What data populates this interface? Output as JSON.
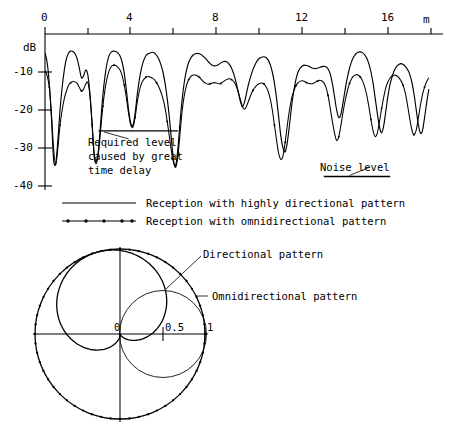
{
  "figure": {
    "title": "",
    "cartesian": {
      "xaxis": {
        "label": "m",
        "ticks_major": [
          "0",
          "4",
          "8",
          "12",
          "16"
        ],
        "tick_values_major": [
          0,
          4,
          8,
          12,
          16
        ],
        "tick_values_minor": [
          2,
          6,
          10,
          14,
          18
        ],
        "range": [
          0,
          18
        ],
        "position": "top"
      },
      "yaxis": {
        "label": "dB",
        "ticks": [
          "-10",
          "-20",
          "-30",
          "-40"
        ],
        "tick_values": [
          -10,
          -20,
          -30,
          -40
        ],
        "range": [
          -40,
          0
        ]
      },
      "annotations": [
        {
          "name": "required-level",
          "text_lines": [
            "Required level",
            "caused by great",
            "time delay"
          ],
          "bar_x": [
            2.5,
            6.2
          ],
          "bar_db": -25.5
        },
        {
          "name": "noise-level",
          "text_lines": [
            "Noise level"
          ],
          "bar_x": [
            13.0,
            16.1
          ],
          "bar_db": -37.5
        }
      ],
      "legend": [
        {
          "label": "Reception with highly directional pattern",
          "style": "solid"
        },
        {
          "label": "Reception with omnidirectional pattern",
          "style": "dotted"
        }
      ]
    },
    "polar": {
      "radial_ticks": [
        "0",
        "0.5",
        "1"
      ],
      "radial_tick_values": [
        0,
        0.5,
        1
      ],
      "labels": [
        {
          "name": "directional-pattern",
          "text": "Directional pattern"
        },
        {
          "name": "omnidirectional-pattern",
          "text": "Omnidirectional pattern"
        }
      ]
    }
  },
  "chart_data": [
    {
      "type": "line",
      "name": "reception-level-vs-distance",
      "title": "",
      "xlabel": "m",
      "ylabel": "dB",
      "xlim": [
        0,
        18
      ],
      "ylim": [
        -40,
        0
      ],
      "grid": false,
      "legend_position": "below",
      "x": [
        0,
        0.1,
        0.2,
        0.3,
        0.4,
        0.5,
        0.6,
        0.7,
        0.8,
        0.9,
        1,
        1.1,
        1.2,
        1.3,
        1.4,
        1.5,
        1.6,
        1.7,
        1.8,
        1.9,
        2,
        2.1,
        2.2,
        2.3,
        2.4,
        2.5,
        2.6,
        2.7,
        2.8,
        2.9,
        3,
        3.1,
        3.2,
        3.3,
        3.4,
        3.5,
        3.6,
        3.7,
        3.8,
        3.9,
        4,
        4.1,
        4.2,
        4.3,
        4.4,
        4.5,
        4.6,
        4.7,
        4.8,
        4.9,
        5,
        5.1,
        5.2,
        5.3,
        5.4,
        5.5,
        5.6,
        5.7,
        5.8,
        5.9,
        6,
        6.1,
        6.2,
        6.3,
        6.4,
        6.5,
        6.6,
        6.7,
        6.8,
        6.9,
        7,
        7.1,
        7.2,
        7.3,
        7.4,
        7.5,
        7.6,
        7.7,
        7.8,
        7.9,
        8,
        8.1,
        8.2,
        8.3,
        8.4,
        8.5,
        8.6,
        8.7,
        8.8,
        8.9,
        9,
        9.1,
        9.2,
        9.3,
        9.4,
        9.5,
        9.6,
        9.7,
        9.8,
        9.9,
        10,
        10.1,
        10.2,
        10.3,
        10.4,
        10.5,
        10.6,
        10.7,
        10.8,
        10.9,
        11,
        11.1,
        11.2,
        11.3,
        11.4,
        11.5,
        11.6,
        11.7,
        11.8,
        11.9,
        12,
        12.1,
        12.2,
        12.3,
        12.4,
        12.5,
        12.6,
        12.7,
        12.8,
        12.9,
        13,
        13.1,
        13.2,
        13.3,
        13.4,
        13.5,
        13.6,
        13.7,
        13.8,
        13.9,
        14,
        14.1,
        14.2,
        14.3,
        14.4,
        14.5,
        14.6,
        14.7,
        14.8,
        14.9,
        15,
        15.1,
        15.2,
        15.3,
        15.4,
        15.5,
        15.6,
        15.7,
        15.8,
        15.9,
        16,
        16.1,
        16.2,
        16.3,
        16.4,
        16.5,
        16.6,
        16.7,
        16.8,
        16.9,
        17,
        17.1,
        17.2,
        17.3,
        17.4,
        17.5,
        17.6,
        17.7,
        17.8,
        17.9,
        18
      ],
      "series": [
        {
          "name": "Reception with highly directional pattern",
          "style": "solid",
          "values": [
            -5,
            -7.5,
            -13,
            -22,
            -33,
            -34,
            -28,
            -20,
            -14,
            -9.5,
            -6.5,
            -5,
            -4.5,
            -4.6,
            -5.2,
            -6.5,
            -9,
            -11.5,
            -11,
            -9.5,
            -10.8,
            -16,
            -24,
            -32,
            -33.5,
            -30,
            -23,
            -16,
            -11,
            -7.5,
            -5.5,
            -4.7,
            -4.5,
            -4.6,
            -5,
            -5.8,
            -7.5,
            -10.5,
            -15,
            -20,
            -23.5,
            -24,
            -21,
            -16,
            -12,
            -9,
            -7,
            -5.8,
            -5.2,
            -5,
            -4.8,
            -5,
            -5.6,
            -6.5,
            -8,
            -10,
            -13,
            -17,
            -22,
            -28,
            -33.5,
            -34.5,
            -30,
            -23,
            -17,
            -12.5,
            -9.5,
            -7.5,
            -6.3,
            -5.6,
            -5.2,
            -5.1,
            -5.2,
            -5.5,
            -6,
            -6.5,
            -7.2,
            -7.8,
            -8.2,
            -8.4,
            -8.3,
            -8,
            -7.6,
            -7.3,
            -7.2,
            -7.4,
            -8,
            -9,
            -10.5,
            -12.5,
            -15,
            -17.5,
            -19,
            -18,
            -15.5,
            -13,
            -11,
            -9.3,
            -8,
            -7,
            -6.4,
            -6.1,
            -6,
            -6.2,
            -6.8,
            -8,
            -10,
            -13,
            -17,
            -22,
            -27,
            -30,
            -31,
            -28.5,
            -24,
            -19,
            -15,
            -12,
            -10,
            -9,
            -8.4,
            -8.2,
            -8.3,
            -8.5,
            -8.8,
            -9,
            -9.1,
            -9,
            -8.8,
            -8.6,
            -8.5,
            -8.6,
            -9.2,
            -10.5,
            -13,
            -16.5,
            -20,
            -22,
            -21,
            -18,
            -14.5,
            -11.5,
            -9,
            -7.2,
            -6,
            -5.2,
            -4.8,
            -4.7,
            -4.9,
            -5.4,
            -6.3,
            -7.8,
            -10,
            -13,
            -17,
            -21,
            -24.5,
            -26,
            -24,
            -20,
            -16,
            -13,
            -11,
            -9.5,
            -8.5,
            -8,
            -7.8,
            -8,
            -8.5,
            -9.3,
            -10.5,
            -12.5,
            -15.5,
            -19.5,
            -23.5,
            -26,
            -25.5,
            -22,
            -18,
            -14.5,
            -11.5,
            -9.5,
            -8,
            -7,
            -6.3,
            -5.9,
            -5.7,
            -5.8,
            -6.2
          ]
        },
        {
          "name": "Reception with omnidirectional pattern",
          "style": "dotted",
          "values": [
            -9.5,
            -11,
            -14,
            -21,
            -30,
            -34.5,
            -30,
            -24,
            -20,
            -17,
            -15,
            -13.5,
            -12.8,
            -12.5,
            -12.6,
            -13,
            -14,
            -15,
            -14.5,
            -13.2,
            -12.8,
            -16.5,
            -24,
            -32.5,
            -34,
            -31,
            -25,
            -19,
            -14.5,
            -11.5,
            -9.5,
            -8.5,
            -8.2,
            -8.3,
            -8.8,
            -9.5,
            -11,
            -13.5,
            -17,
            -21,
            -24,
            -24.5,
            -22,
            -18,
            -15,
            -13,
            -12,
            -11.4,
            -11.2,
            -11.3,
            -11.6,
            -12,
            -12.8,
            -13.8,
            -15.2,
            -17,
            -19.5,
            -23,
            -27,
            -31,
            -34,
            -35,
            -32,
            -26,
            -20,
            -16,
            -13.5,
            -12,
            -11.2,
            -10.8,
            -10.8,
            -11,
            -11.4,
            -12,
            -12.6,
            -13,
            -13.2,
            -13.1,
            -12.9,
            -12.8,
            -12.9,
            -13.1,
            -13,
            -12.6,
            -12.2,
            -11.9,
            -11.8,
            -12,
            -12.5,
            -13.5,
            -15,
            -17,
            -19,
            -19.8,
            -19,
            -17.5,
            -16,
            -14.8,
            -14,
            -13.4,
            -13,
            -12.9,
            -13.1,
            -13.8,
            -15,
            -17,
            -20,
            -24,
            -28,
            -31.5,
            -33,
            -32,
            -28.5,
            -24,
            -20,
            -17,
            -15,
            -13.6,
            -12.8,
            -12.4,
            -12.3,
            -12.5,
            -12.8,
            -13,
            -13.1,
            -13,
            -12.7,
            -12.4,
            -12.2,
            -12.3,
            -12.8,
            -14,
            -16.2,
            -19.5,
            -23,
            -26,
            -28,
            -27,
            -24,
            -20.5,
            -17.5,
            -15,
            -13,
            -11.7,
            -11,
            -10.7,
            -10.8,
            -11.3,
            -12.2,
            -13.8,
            -16,
            -19,
            -22.5,
            -25.5,
            -27,
            -26,
            -23,
            -19.5,
            -16.5,
            -14,
            -12.5,
            -11.5,
            -11,
            -10.8,
            -11,
            -11.5,
            -12.3,
            -13.5,
            -15.5,
            -18.5,
            -22,
            -25,
            -26.5,
            -25.5,
            -22.5,
            -19,
            -16,
            -14,
            -12.5,
            -11.5,
            -10.8,
            -10.4,
            -10.2,
            -10.2,
            -10.5,
            -11
          ]
        }
      ]
    },
    {
      "type": "line",
      "name": "antenna-polar-patterns",
      "coordinate_system": "polar",
      "title": "",
      "radial_ticks": [
        0,
        0.5,
        1
      ],
      "rlim": [
        0,
        1
      ],
      "grid": false,
      "series": [
        {
          "name": "Omnidirectional pattern",
          "style": "dotted-circle",
          "description": "unit circle, radius 1 at all angles",
          "radius": 1
        },
        {
          "name": "Directional pattern",
          "style": "solid-cardioid",
          "description": "cardioid r = 0.5*(1 + cos(theta - 105deg)), max radius 1 toward upper-left",
          "max_radius": 1,
          "main_lobe_direction_deg": 105
        },
        {
          "name": "Reference circle",
          "style": "thin-circle",
          "description": "thin reference circle of radius 0.5 centred on the 0.5 point",
          "radius": 0.5
        }
      ]
    }
  ]
}
